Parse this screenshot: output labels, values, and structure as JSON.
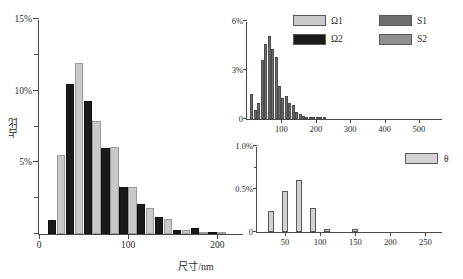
{
  "colors": {
    "omega1": "#c9c9c9",
    "omega2": "#1a1a1a",
    "s1": "#6e6e6e",
    "s2": "#8f8f8f",
    "theta": "#d2d2d2",
    "axis": "#4a4a4a",
    "text": "#2a2a2a",
    "background": "#ffffff"
  },
  "legend": {
    "items": [
      {
        "label": "Ω1",
        "color": "#c9c9c9",
        "name": "legend-omega1"
      },
      {
        "label": "S1",
        "color": "#6e6e6e",
        "name": "legend-s1"
      },
      {
        "label": "Ω2",
        "color": "#1a1a1a",
        "name": "legend-omega2"
      },
      {
        "label": "S2",
        "color": "#8f8f8f",
        "name": "legend-s2"
      }
    ]
  },
  "chart_data": [
    {
      "id": "main",
      "type": "bar",
      "title": "",
      "xlabel": "尺寸/nm",
      "ylabel": "占比",
      "xlim": [
        0,
        230
      ],
      "ylim": [
        0,
        15
      ],
      "xticks": [
        0,
        100,
        200
      ],
      "xticklabels": [
        "0",
        "100",
        "200"
      ],
      "yticks": [
        0,
        2.5,
        5,
        7.5,
        10,
        12.5,
        15
      ],
      "yticklabels": [
        "",
        "",
        "5%",
        "",
        "10%",
        "",
        "15%"
      ],
      "grid": false,
      "legend_position": "top-right",
      "bin_width": 10,
      "categories": [
        20,
        30,
        40,
        50,
        60,
        70,
        80,
        90,
        100,
        110,
        120,
        130,
        140,
        150,
        160,
        170,
        180,
        190,
        200,
        210
      ],
      "series": [
        {
          "name": "Ω2",
          "color": "#1a1a1a",
          "values": [
            1.0,
            0.0,
            10.5,
            0.0,
            9.3,
            0.0,
            6.0,
            0.0,
            3.3,
            0.0,
            2.1,
            0.0,
            1.2,
            0.0,
            0.25,
            0.0,
            0.45,
            0.0,
            0.1,
            0.0
          ]
        },
        {
          "name": "Ω1",
          "color": "#c9c9c9",
          "values": [
            0.0,
            5.5,
            0.0,
            11.9,
            0.0,
            7.9,
            0.0,
            6.1,
            0.0,
            3.25,
            0.0,
            1.8,
            0.0,
            1.05,
            0.0,
            0.3,
            0.0,
            0.12,
            0.0,
            0.1
          ]
        }
      ]
    },
    {
      "id": "inset-top",
      "type": "bar",
      "title": "",
      "xlabel": "",
      "ylabel": "",
      "xlim": [
        0,
        570
      ],
      "ylim": [
        0,
        6
      ],
      "xticks": [
        100,
        200,
        300,
        400,
        500
      ],
      "xticklabels": [
        "100",
        "200",
        "300",
        "400",
        "500"
      ],
      "yticks": [
        0,
        3,
        6
      ],
      "yticklabels": [
        "0",
        "3%",
        "6%"
      ],
      "grid": false,
      "bin_width": 10,
      "categories": [
        15,
        25,
        35,
        45,
        55,
        65,
        75,
        85,
        95,
        105,
        115,
        125,
        135,
        145,
        155,
        165,
        175,
        185,
        195,
        205,
        215,
        225
      ],
      "values": [
        1.55,
        0.55,
        0.95,
        3.6,
        4.6,
        5.1,
        4.3,
        3.8,
        2.05,
        1.3,
        1.4,
        0.95,
        0.85,
        0.4,
        0.3,
        0.18,
        0.15,
        0.12,
        0.1,
        0.08,
        0.06,
        0.05
      ],
      "series_color": "#6e6e6e"
    },
    {
      "id": "inset-bottom",
      "type": "bar",
      "title": "",
      "xlabel": "",
      "ylabel": "",
      "xlim": [
        10,
        275
      ],
      "ylim": [
        0,
        1.0
      ],
      "xticks": [
        50,
        100,
        150,
        200,
        250
      ],
      "xticklabels": [
        "50",
        "100",
        "150",
        "200",
        "250"
      ],
      "yticks": [
        0,
        0.5,
        1.0
      ],
      "yticklabels": [
        "0",
        "0.5%",
        "1.0%"
      ],
      "grid": false,
      "legend_position": "top-right",
      "bar_width": 6,
      "categories": [
        30,
        50,
        70,
        90,
        110,
        150
      ],
      "values": [
        0.24,
        0.48,
        0.6,
        0.28,
        0.04,
        0.03
      ],
      "series_name": "θ",
      "series_color": "#d2d2d2"
    }
  ]
}
